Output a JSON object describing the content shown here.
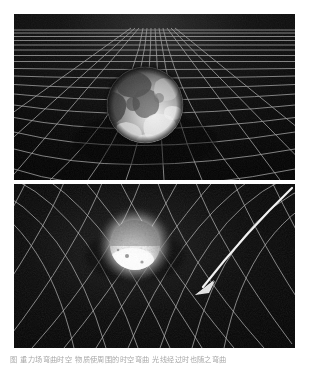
{
  "document": {
    "kind": "textbook-figure",
    "page_background": "#ffffff"
  },
  "panels": [
    {
      "id": "panel-top",
      "name": "earth-spacetime-grid",
      "subject": "Earth",
      "description": "Earth resting on a perspective spacetime grid that sags beneath it",
      "background": "#060606",
      "grid_color": "#8e8e8e",
      "body": {
        "name": "earth-sphere",
        "center_x": 131,
        "center_y": 91,
        "radius": 38,
        "highlight": "#f2f2f2",
        "shadow": "#1a1a1a"
      },
      "has_arrow": false
    },
    {
      "id": "panel-bottom",
      "name": "star-spacetime-funnel",
      "subject": "Star",
      "description": "A bright star in a deep funnel of curved spacetime with a light ray deflected toward it",
      "background": "#060606",
      "grid_color": "#b4b4b4",
      "body": {
        "name": "star-sphere",
        "center_x": 121,
        "center_y": 61,
        "radius": 25,
        "highlight": "#ffffff",
        "shadow": "#6d6d6d"
      },
      "has_arrow": true,
      "arrow": {
        "name": "light-ray-arrow",
        "color": "#e8e8e8",
        "start_x": 278,
        "start_y": 4,
        "end_x": 182,
        "end_y": 108
      }
    }
  ],
  "caption": {
    "text": "图 重力场弯曲时空 物质使周围的时空弯曲 光线经过时也随之弯曲",
    "clipped": true
  },
  "colors": {
    "page": "#ffffff",
    "panel_bg": "#060606",
    "grid": "#9a9a9a",
    "arrow": "#e8e8e8",
    "caption": "#5d5d5d"
  }
}
